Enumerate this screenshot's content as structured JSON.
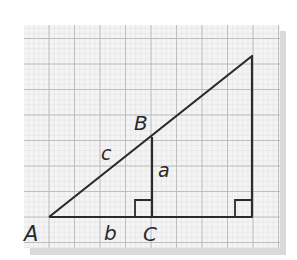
{
  "diagram": {
    "type": "similar right triangles on grid paper",
    "grid": {
      "x0": 24,
      "y0": 25,
      "x1": 280,
      "y1": 248,
      "spacing": 25.5,
      "minor_spacing": 5.1,
      "major_color": "#b8b8b8",
      "minor_color": "#e2e2e2",
      "background": "#f3f3f3",
      "shadow_color": "#d6d6d6"
    },
    "vertices": {
      "A": {
        "x": 49,
        "y": 217
      },
      "B": {
        "x": 152,
        "y": 137
      },
      "C": {
        "x": 152,
        "y": 217
      },
      "top": {
        "x": 252,
        "y": 56
      },
      "bottom_right": {
        "x": 252,
        "y": 217
      }
    },
    "labels": {
      "A": "A",
      "B": "B",
      "C": "C",
      "a": "a",
      "b": "b",
      "c": "c"
    },
    "right_angle_markers": [
      {
        "corner": "C",
        "size": 17
      },
      {
        "corner": "bottom_right",
        "size": 17
      }
    ],
    "line_color": "#2b2b2b"
  }
}
